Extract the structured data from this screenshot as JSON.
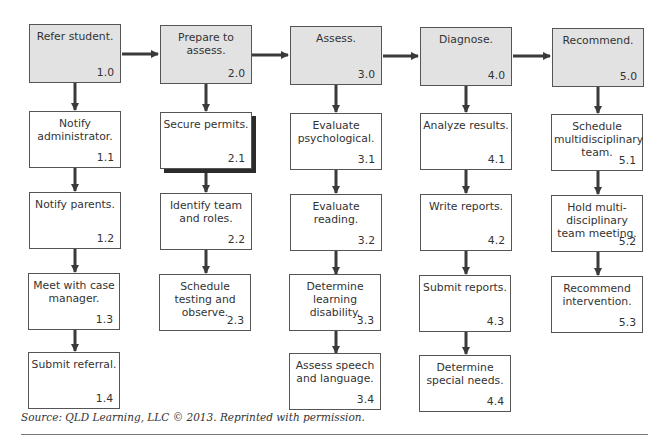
{
  "columns": [
    {
      "head": {
        "label": "Refer student.",
        "num": "1.0"
      },
      "steps": [
        {
          "label": "Notify administrator.",
          "num": "1.1"
        },
        {
          "label": "Notify parents.",
          "num": "1.2"
        },
        {
          "label": "Meet with case manager.",
          "num": "1.3"
        },
        {
          "label": "Submit referral.",
          "num": "1.4"
        }
      ]
    },
    {
      "head": {
        "label": "Prepare to assess.",
        "num": "2.0"
      },
      "steps": [
        {
          "label": "Secure permits.",
          "num": "2.1"
        },
        {
          "label": "Identify team and roles.",
          "num": "2.2"
        },
        {
          "label": "Schedule testing and observe.",
          "num": "2.3"
        }
      ]
    },
    {
      "head": {
        "label": "Assess.",
        "num": "3.0"
      },
      "steps": [
        {
          "label": "Evaluate psychological.",
          "num": "3.1"
        },
        {
          "label": "Evaluate reading.",
          "num": "3.2"
        },
        {
          "label": "Determine learning disability.",
          "num": "3.3"
        },
        {
          "label": "Assess speech and language.",
          "num": "3.4"
        }
      ]
    },
    {
      "head": {
        "label": "Diagnose.",
        "num": "4.0"
      },
      "steps": [
        {
          "label": "Analyze results.",
          "num": "4.1"
        },
        {
          "label": "Write reports.",
          "num": "4.2"
        },
        {
          "label": "Submit reports.",
          "num": "4.3"
        },
        {
          "label": "Determine special needs.",
          "num": "4.4"
        }
      ]
    },
    {
      "head": {
        "label": "Recommend.",
        "num": "5.0"
      },
      "steps": [
        {
          "label": "Schedule multidisciplinary team.",
          "num": "5.1"
        },
        {
          "label": "Hold multi-disciplinary team meeting.",
          "num": "5.2"
        },
        {
          "label": "Recommend intervention.",
          "num": "5.3"
        }
      ]
    }
  ],
  "source": "Source: QLD Learning, LLC © 2013. Reprinted with permission.",
  "colors": {
    "head_fill": "#e2e2e2",
    "line": "#3a3a3a",
    "border": "#555555"
  }
}
